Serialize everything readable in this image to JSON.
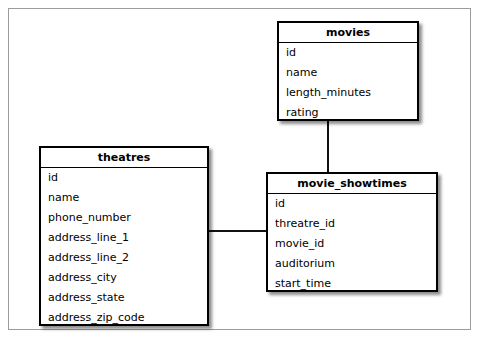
{
  "diagram": {
    "background_color": "#ffffff",
    "frame_border_color": "#9c9c9c",
    "box_border_color": "#000000",
    "connector_color": "#111111"
  },
  "entities": [
    {
      "key": "movies",
      "name": "movies",
      "fields": [
        "id",
        "name",
        "length_minutes",
        "rating"
      ]
    },
    {
      "key": "theatres",
      "name": "theatres",
      "fields": [
        "id",
        "name",
        "phone_number",
        "address_line_1",
        "address_line_2",
        "address_city",
        "address_state",
        "address_zip_code"
      ]
    },
    {
      "key": "movie_showtimes",
      "name": "movie_showtimes",
      "fields": [
        "id",
        "threatre_id",
        "movie_id",
        "auditorium",
        "start_time"
      ]
    }
  ],
  "relationships": [
    {
      "key": "movies-to-movie_showtimes",
      "from": "movies",
      "to": "movie_showtimes",
      "orientation": "vertical"
    },
    {
      "key": "theatres-to-movie_showtimes",
      "from": "theatres",
      "to": "movie_showtimes",
      "orientation": "horizontal"
    }
  ]
}
